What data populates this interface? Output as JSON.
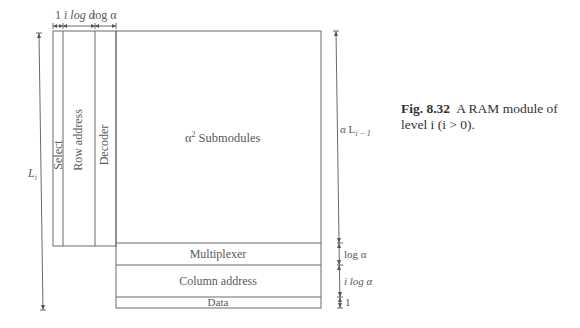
{
  "diagram": {
    "blocks": {
      "select": "Select",
      "row_address": "Row address",
      "decoder": "Decoder",
      "submodules": "α² Submodules",
      "submodules_base": "α",
      "submodules_exp": "2",
      "submodules_text": "Submodules",
      "multiplexer": "Multiplexer",
      "column_address": "Column address",
      "data": "Data"
    },
    "top_dimensions": {
      "select_width": "1",
      "row_address_width": "i log α",
      "decoder_width": "log α"
    },
    "left_dimension": {
      "label": "L",
      "subscript": "i"
    },
    "right_dimensions": {
      "submodules_height": "α L",
      "submodules_height_sub": "i − 1",
      "multiplexer_height": "log α",
      "column_address_height": "i log α",
      "data_height": "1"
    }
  },
  "caption": {
    "figure_number": "Fig. 8.32",
    "text_line1": "A RAM module of",
    "text_line2": "level i (i > 0)."
  }
}
